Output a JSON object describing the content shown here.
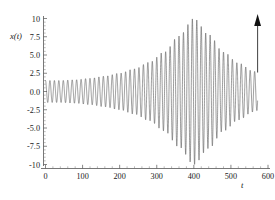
{
  "chart_data": {
    "type": "line",
    "title": "",
    "subtitle": "",
    "xlabel": "t",
    "ylabel": "x(t)",
    "xlim": [
      -10,
      610
    ],
    "ylim": [
      -10,
      10
    ],
    "xticks": [
      0,
      100,
      200,
      300,
      400,
      500,
      600
    ],
    "xticklabels": [
      "0",
      "100",
      "200",
      "300",
      "400",
      "500",
      "600"
    ],
    "yticks": [
      -10,
      -7.5,
      -5.0,
      -2.5,
      0.0,
      2.5,
      5.0,
      7.5,
      10
    ],
    "yticklabels": [
      "-10",
      "-7.5",
      "-5.0",
      "-2.5",
      "0.0",
      "2.5",
      "5.0",
      "7.5",
      "10"
    ],
    "x_minor_tick_step": 20,
    "y_minor_tick_step": 0.5,
    "grid": false,
    "legend": null,
    "series": [
      {
        "name": "x(t)",
        "description": "beat / amplitude-modulated oscillation",
        "carrier_period": 12.0,
        "carrier_phase_deg": 90,
        "envelope_peak_t": 400,
        "envelope_peak_value": 10.0,
        "envelope_start_value": 1.5,
        "envelope_end_value": 2.6,
        "t_start": 0,
        "t_end": 572,
        "envelope_samples_t": [
          0,
          40,
          80,
          120,
          160,
          200,
          240,
          280,
          320,
          360,
          400,
          440,
          480,
          520,
          560,
          572
        ],
        "envelope_samples_amplitude": [
          1.5,
          1.5,
          1.6,
          1.8,
          2.1,
          2.5,
          3.1,
          4.0,
          5.4,
          7.6,
          10.0,
          7.8,
          5.4,
          3.9,
          2.8,
          2.6
        ],
        "value_at_t0": 1.0
      }
    ],
    "annotations": [
      {
        "name": "up-arrow",
        "type": "arrow",
        "t": 572,
        "y_start": 2.6,
        "y_end": 10.6,
        "direction": "up",
        "label": ""
      }
    ]
  },
  "axes": {
    "y_label_text": "x(t)",
    "x_label_text": "t"
  }
}
